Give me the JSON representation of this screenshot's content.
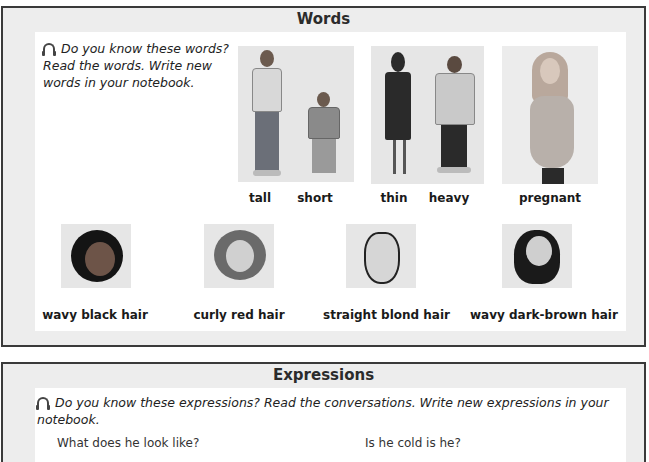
{
  "words": {
    "title": "Words",
    "instruction": {
      "icon": "headphones-icon",
      "line1": "Do you know these words?",
      "line2": "Read the words.  Write new",
      "line3": "words in your notebook."
    },
    "body_types": [
      {
        "label": "tall"
      },
      {
        "label": "short"
      },
      {
        "label": "thin"
      },
      {
        "label": "heavy"
      },
      {
        "label": "pregnant"
      }
    ],
    "hair_types": [
      {
        "label": "wavy black hair"
      },
      {
        "label": "curly red hair"
      },
      {
        "label": "straight blond hair"
      },
      {
        "label": "wavy dark-brown hair"
      }
    ]
  },
  "expressions": {
    "title": "Expressions",
    "instruction": {
      "icon": "headphones-icon",
      "line1": "Do you know these expressions? Read the conversations. Write new expressions in your",
      "line2": "notebook."
    },
    "conversation_left": "What does he look like?",
    "conversation_right": "Is he cold is he?"
  },
  "colors": {
    "border": "#3a3a3a",
    "panel_bg": "#ededed",
    "inner_bg": "#ffffff",
    "photo_bg": "#e6e6e6"
  }
}
